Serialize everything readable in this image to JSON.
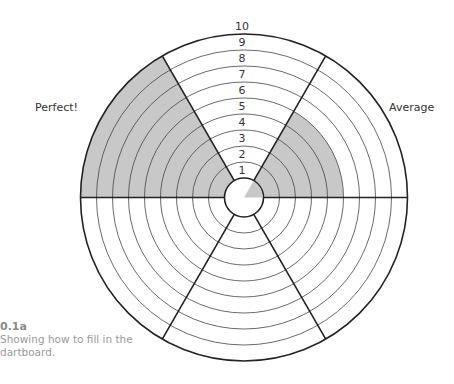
{
  "figure": {
    "caption_id": "0.1a",
    "caption_text": "Showing how to fill in the dartboard."
  },
  "dartboard": {
    "segments_count": 6,
    "rings_count": 9,
    "scale_labels": [
      "1",
      "2",
      "3",
      "4",
      "5",
      "6",
      "7",
      "8",
      "9",
      "10"
    ],
    "colors": {
      "fill": "#c8c8c8",
      "line": "#222222",
      "ring_line": "#444444"
    },
    "segments": [
      {
        "name": "Average",
        "label": "Average",
        "angle_from_deg": 0,
        "angle_to_deg": 60,
        "score": 5,
        "center_filled": true
      },
      {
        "name": "top",
        "label": "",
        "angle_from_deg": 60,
        "angle_to_deg": 120,
        "score": 0,
        "center_filled": false
      },
      {
        "name": "Perfect!",
        "label": "Perfect!",
        "angle_from_deg": 120,
        "angle_to_deg": 180,
        "score": 9,
        "center_filled": false
      },
      {
        "name": "lower-left",
        "label": "",
        "angle_from_deg": 180,
        "angle_to_deg": 240,
        "score": 0,
        "center_filled": false
      },
      {
        "name": "bottom",
        "label": "",
        "angle_from_deg": 240,
        "angle_to_deg": 300,
        "score": 0,
        "center_filled": false
      },
      {
        "name": "lower-right",
        "label": "",
        "angle_from_deg": 300,
        "angle_to_deg": 360,
        "score": 0,
        "center_filled": false
      }
    ],
    "labels": {
      "perfect": "Perfect!",
      "average": "Average"
    }
  }
}
